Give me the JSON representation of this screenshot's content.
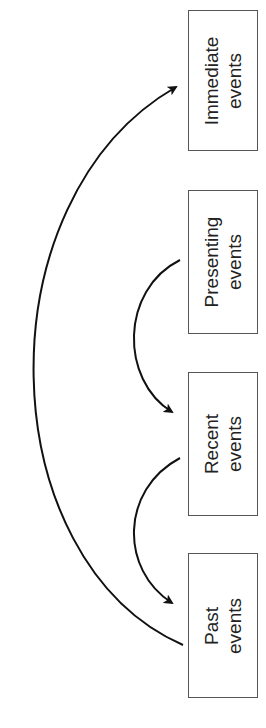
{
  "diagram": {
    "orientation": "rotated-90-ccw",
    "boxes": [
      {
        "id": "immediate",
        "line1": "Immediate",
        "line2": "events"
      },
      {
        "id": "presenting",
        "line1": "Presenting",
        "line2": "events"
      },
      {
        "id": "recent",
        "line1": "Recent",
        "line2": "events"
      },
      {
        "id": "past",
        "line1": "Past",
        "line2": "events"
      }
    ],
    "arrows": [
      {
        "from": "presenting",
        "to": "recent"
      },
      {
        "from": "recent",
        "to": "past"
      },
      {
        "from": "past",
        "to": "immediate"
      }
    ],
    "colors": {
      "line": "#111111",
      "box_border": "#555555",
      "text": "#222222"
    }
  }
}
